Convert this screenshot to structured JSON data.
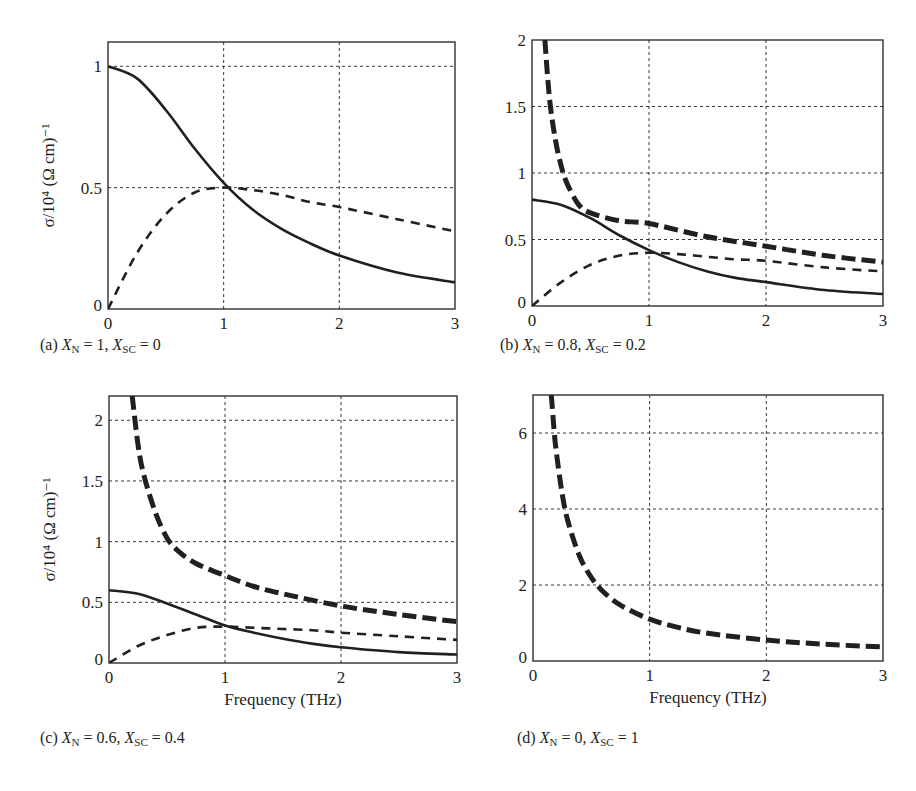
{
  "colors": {
    "ink": "#231f20",
    "grid": "#231f20",
    "background": "#ffffff"
  },
  "chart_data": [
    {
      "id": "a",
      "type": "line",
      "caption": {
        "prefix": "(a)",
        "XN": "1",
        "XSC": "0"
      },
      "xlabel": "",
      "ylabel": "σ/10⁴ (Ω cm)⁻¹",
      "xlim": [
        0,
        3
      ],
      "ylim": [
        0,
        1.1
      ],
      "xticks": [
        "0",
        "1",
        "2",
        "3"
      ],
      "yticks": [
        {
          "v": 0,
          "label": "0"
        },
        {
          "v": 0.5,
          "label": "0.5"
        },
        {
          "v": 1,
          "label": "1"
        }
      ],
      "grid": true,
      "box": {
        "left": 108,
        "top": 42,
        "right": 455,
        "bottom": 309
      },
      "series": [
        {
          "name": "σ1 (real, normal)",
          "style": "solid",
          "x": [
            0,
            0.25,
            0.5,
            0.75,
            1.0,
            1.25,
            1.5,
            1.75,
            2.0,
            2.5,
            3.0
          ],
          "y": [
            1.0,
            0.95,
            0.82,
            0.66,
            0.52,
            0.41,
            0.33,
            0.27,
            0.22,
            0.15,
            0.11
          ]
        },
        {
          "name": "σ2 (imag, normal)",
          "style": "dashed",
          "x": [
            0,
            0.25,
            0.5,
            0.75,
            1.0,
            1.25,
            1.5,
            1.75,
            2.0,
            2.5,
            3.0
          ],
          "y": [
            0.0,
            0.23,
            0.39,
            0.48,
            0.5,
            0.49,
            0.47,
            0.44,
            0.42,
            0.37,
            0.32
          ]
        }
      ]
    },
    {
      "id": "b",
      "type": "line",
      "caption": {
        "prefix": "(b)",
        "XN": "0.8",
        "XSC": "0.2"
      },
      "xlabel": "",
      "ylabel": "",
      "xlim": [
        0,
        3
      ],
      "ylim": [
        0,
        2
      ],
      "xticks": [
        "0",
        "1",
        "2",
        "3"
      ],
      "yticks": [
        {
          "v": 0,
          "label": "0"
        },
        {
          "v": 0.5,
          "label": "0.5"
        },
        {
          "v": 1,
          "label": "1"
        },
        {
          "v": 1.5,
          "label": "1.5"
        },
        {
          "v": 2,
          "label": "2"
        }
      ],
      "grid": true,
      "box": {
        "left": 532,
        "top": 40,
        "right": 883,
        "bottom": 306
      },
      "series": [
        {
          "name": "σ1 (real, normal)",
          "style": "solid",
          "x": [
            0,
            0.25,
            0.5,
            0.75,
            1.0,
            1.25,
            1.5,
            1.75,
            2.0,
            2.5,
            3.0
          ],
          "y": [
            0.8,
            0.76,
            0.66,
            0.53,
            0.42,
            0.33,
            0.26,
            0.21,
            0.18,
            0.12,
            0.09
          ]
        },
        {
          "name": "σ2 (imag, normal)",
          "style": "dashed",
          "x": [
            0,
            0.25,
            0.5,
            0.75,
            1.0,
            1.25,
            1.5,
            1.75,
            2.0,
            2.5,
            3.0
          ],
          "y": [
            0.0,
            0.18,
            0.31,
            0.38,
            0.4,
            0.39,
            0.37,
            0.35,
            0.34,
            0.29,
            0.26
          ]
        },
        {
          "name": "σ2 total (normal + superconducting)",
          "style": "thick-dashed",
          "x": [
            0.11,
            0.15,
            0.2,
            0.25,
            0.3,
            0.4,
            0.5,
            0.75,
            1.0,
            1.5,
            2.0,
            2.5,
            3.0
          ],
          "y": [
            2.0,
            1.56,
            1.25,
            1.05,
            0.92,
            0.76,
            0.7,
            0.64,
            0.62,
            0.52,
            0.45,
            0.38,
            0.33
          ]
        }
      ]
    },
    {
      "id": "c",
      "type": "line",
      "caption": {
        "prefix": "(c)",
        "XN": "0.6",
        "XSC": "0.4"
      },
      "xlabel": "Frequency (THz)",
      "ylabel": "σ/10⁴ (Ω cm)⁻¹",
      "xlim": [
        0,
        3
      ],
      "ylim": [
        0,
        2.2
      ],
      "xticks": [
        "0",
        "1",
        "2",
        "3"
      ],
      "yticks": [
        {
          "v": 0,
          "label": "0"
        },
        {
          "v": 0.5,
          "label": "0.5"
        },
        {
          "v": 1,
          "label": "1"
        },
        {
          "v": 1.5,
          "label": "1.5"
        },
        {
          "v": 2,
          "label": "2"
        }
      ],
      "grid": true,
      "box": {
        "left": 109,
        "top": 396,
        "right": 457,
        "bottom": 663
      },
      "series": [
        {
          "name": "σ1 (real, normal)",
          "style": "solid",
          "x": [
            0,
            0.25,
            0.5,
            0.75,
            1.0,
            1.25,
            1.5,
            1.75,
            2.0,
            2.5,
            3.0
          ],
          "y": [
            0.6,
            0.57,
            0.49,
            0.4,
            0.31,
            0.25,
            0.2,
            0.16,
            0.13,
            0.09,
            0.07
          ]
        },
        {
          "name": "σ2 (imag, normal)",
          "style": "dashed",
          "x": [
            0,
            0.25,
            0.5,
            0.75,
            1.0,
            1.25,
            1.5,
            1.75,
            2.0,
            2.5,
            3.0
          ],
          "y": [
            0.0,
            0.14,
            0.23,
            0.29,
            0.3,
            0.29,
            0.28,
            0.27,
            0.25,
            0.22,
            0.19
          ]
        },
        {
          "name": "σ2 total (normal + superconducting)",
          "style": "thick-dashed",
          "x": [
            0.2,
            0.25,
            0.3,
            0.4,
            0.5,
            0.6,
            0.75,
            1.0,
            1.25,
            1.5,
            2.0,
            2.5,
            3.0
          ],
          "y": [
            2.2,
            1.8,
            1.55,
            1.24,
            1.03,
            0.92,
            0.82,
            0.72,
            0.63,
            0.57,
            0.47,
            0.4,
            0.34
          ]
        }
      ]
    },
    {
      "id": "d",
      "type": "line",
      "caption": {
        "prefix": "(d)",
        "XN": "0",
        "XSC": "1"
      },
      "xlabel": "Frequency (THz)",
      "ylabel": "",
      "xlim": [
        0,
        3
      ],
      "ylim": [
        0,
        7
      ],
      "xticks": [
        "0",
        "1",
        "2",
        "3"
      ],
      "yticks": [
        {
          "v": 0,
          "label": "0"
        },
        {
          "v": 2,
          "label": "2"
        },
        {
          "v": 4,
          "label": "4"
        },
        {
          "v": 6,
          "label": "6"
        }
      ],
      "grid": true,
      "box": {
        "left": 533,
        "top": 395,
        "right": 883,
        "bottom": 661
      },
      "series": [
        {
          "name": "σ2 (superconducting)",
          "style": "thick-dashed",
          "x": [
            0.157,
            0.18,
            0.2,
            0.25,
            0.3,
            0.4,
            0.5,
            0.6,
            0.75,
            1.0,
            1.25,
            1.5,
            2.0,
            2.5,
            3.0
          ],
          "y": [
            7.0,
            6.1,
            5.5,
            4.4,
            3.67,
            2.75,
            2.2,
            1.83,
            1.47,
            1.1,
            0.88,
            0.73,
            0.55,
            0.44,
            0.37
          ]
        }
      ]
    }
  ]
}
